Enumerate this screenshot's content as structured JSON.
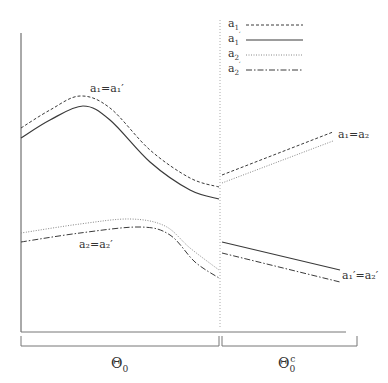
{
  "diagram": {
    "colors": {
      "line": "#3a3a3a",
      "axis": "#555555",
      "divider": "#aaaaaa",
      "dotted": "#888888"
    },
    "legend": [
      {
        "base": "a",
        "sub": "1",
        "prime": "",
        "style": "dashed"
      },
      {
        "base": "a",
        "sub": "1",
        "prime": "′",
        "style": "solid"
      },
      {
        "base": "a",
        "sub": "2",
        "prime": "",
        "style": "dotted"
      },
      {
        "base": "a",
        "sub": "2",
        "prime": "′",
        "style": "dashdot"
      }
    ],
    "curve_labels": {
      "top_left": "a₁=a₁′",
      "bottom_left": "a₂=a₂′",
      "top_right": "a₁=a₂",
      "bottom_right": "a₁′=a₂′"
    },
    "regions": {
      "left": {
        "base": "Θ",
        "sub": "0",
        "sup": ""
      },
      "right": {
        "base": "Θ",
        "sub": "0",
        "sup": "c"
      }
    },
    "series": [
      {
        "name": "a1",
        "style": "dashed",
        "segment": "left",
        "points": [
          [
            21,
            128
          ],
          [
            50,
            110
          ],
          [
            80,
            96
          ],
          [
            110,
            108
          ],
          [
            150,
            150
          ],
          [
            190,
            178
          ],
          [
            219,
            187
          ]
        ]
      },
      {
        "name": "a1'",
        "style": "solid",
        "segment": "left",
        "points": [
          [
            21,
            138
          ],
          [
            50,
            120
          ],
          [
            83,
            106
          ],
          [
            110,
            120
          ],
          [
            150,
            162
          ],
          [
            190,
            190
          ],
          [
            219,
            199
          ]
        ]
      },
      {
        "name": "a2",
        "style": "dotted",
        "segment": "left",
        "points": [
          [
            21,
            233
          ],
          [
            80,
            224
          ],
          [
            130,
            219
          ],
          [
            165,
            226
          ],
          [
            190,
            248
          ],
          [
            219,
            270
          ]
        ]
      },
      {
        "name": "a2'",
        "style": "dashdot",
        "segment": "left",
        "points": [
          [
            21,
            242
          ],
          [
            80,
            233
          ],
          [
            140,
            227
          ],
          [
            170,
            235
          ],
          [
            195,
            262
          ],
          [
            219,
            278
          ]
        ]
      },
      {
        "name": "a1",
        "style": "dashed",
        "segment": "right",
        "points": [
          [
            222,
            175
          ],
          [
            333,
            132
          ]
        ]
      },
      {
        "name": "a2",
        "style": "dotted",
        "segment": "right",
        "points": [
          [
            222,
            183
          ],
          [
            333,
            141
          ]
        ]
      },
      {
        "name": "a1'",
        "style": "solid",
        "segment": "right",
        "points": [
          [
            222,
            242
          ],
          [
            340,
            270
          ]
        ]
      },
      {
        "name": "a2'",
        "style": "dashdot",
        "segment": "right",
        "points": [
          [
            222,
            253
          ],
          [
            340,
            282
          ]
        ]
      }
    ]
  }
}
